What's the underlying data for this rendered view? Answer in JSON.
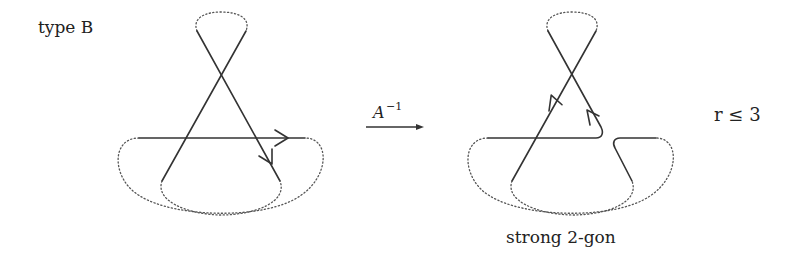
{
  "labels": {
    "type": "type B",
    "move_base": "A",
    "move_exp": "−1",
    "condition": "r ≤ 3",
    "caption": "strong 2-gon"
  },
  "colors": {
    "line": "#333333",
    "dotted": "#555555",
    "background": "#ffffff"
  },
  "diagrams": [
    {
      "name": "before-move",
      "description": "curve with crossing, loop on top, horizontal arc with arrow, two lower dotted loops"
    },
    {
      "name": "after-move",
      "description": "result of A^-1 move, horizontal arc split with smoothing, forming strong 2-gon"
    }
  ]
}
